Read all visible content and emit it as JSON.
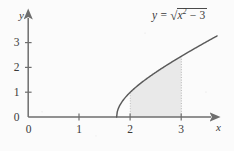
{
  "figure": {
    "background_color": "#fbfbfb",
    "axis_color": "#6e6e6e",
    "curve_color": "#5a5a5a",
    "fill_color": "#e9e9e9",
    "text_color": "#3a3a3a"
  },
  "equation": {
    "lhs": "y",
    "equals": "=",
    "radical_sign": "√",
    "radicand_base": "x",
    "radicand_exponent": "2",
    "radicand_rest": "− 3",
    "full_text": "y = √(x² − 3)"
  },
  "axes": {
    "x_axis_name": "x",
    "y_axis_name": "y",
    "origin_label": "0",
    "x_tick_labels": [
      "1",
      "2",
      "3"
    ],
    "y_tick_labels": [
      "1",
      "2",
      "3"
    ],
    "x_origin_tick_label": "0"
  },
  "chart_data": {
    "type": "line",
    "title": "",
    "subtitle": "",
    "xlabel": "x",
    "ylabel": "y",
    "annotations": [
      "y = √(x² − 3)"
    ],
    "legend": [],
    "legend_position": "none",
    "grid": false,
    "xlim": [
      -0.55,
      3.71
    ],
    "ylim": [
      -0.17,
      3.6
    ],
    "xticks": [
      0,
      1,
      2,
      3
    ],
    "yticks": [
      0,
      1,
      2,
      3
    ],
    "xtick_labels": [
      "0",
      "1",
      "2",
      "3"
    ],
    "ytick_labels": [
      "0",
      "1",
      "2",
      "3"
    ],
    "series": [
      {
        "name": "y = sqrt(x^2 - 3)",
        "type": "line",
        "domain_start": 1.7320508,
        "domain_end": 3.7,
        "x": [
          1.7320508,
          1.76,
          1.8,
          1.85,
          1.9,
          1.95,
          2.0,
          2.1,
          2.2,
          2.3,
          2.4,
          2.5,
          2.6,
          2.7,
          2.8,
          2.9,
          3.0,
          3.1,
          3.2,
          3.3,
          3.4,
          3.5,
          3.6,
          3.7
        ],
        "y": [
          0.0,
          0.3126,
          0.4648,
          0.6225,
          0.755,
          0.8732,
          1.0,
          1.2042,
          1.3928,
          1.5716,
          1.7436,
          1.9105,
          2.0736,
          2.2336,
          2.3916,
          2.5475,
          2.4495,
          2.6851,
          2.8408,
          2.995,
          3.148,
          3.2998,
          3.451,
          3.6014
        ]
      }
    ],
    "curve_formula": "y = sqrt(x^2 - 3)",
    "shaded_region": {
      "label": "area under curve",
      "x_start": 2,
      "x_end": 3,
      "y_at_x_start": 1.0,
      "y_at_x_end": 2.4495,
      "fill_color": "#e9e9e9"
    },
    "dotted_guides": [
      {
        "x": 2,
        "y_from": 0,
        "y_to": 1.0
      },
      {
        "x": 3,
        "y_from": 0,
        "y_to": 2.4495
      }
    ]
  }
}
